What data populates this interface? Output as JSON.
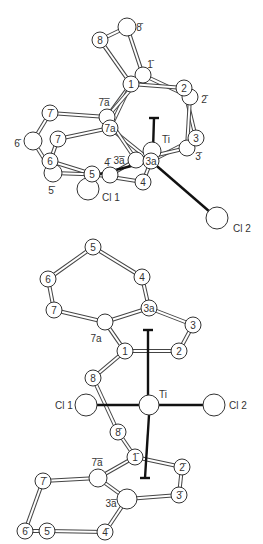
{
  "figure": {
    "type": "molecular structure diagram",
    "views": [
      {
        "name": "top-view",
        "atoms": [
          {
            "id": "8",
            "label": "8",
            "x": 100,
            "y": 40,
            "r": 8,
            "labeled_inside": true
          },
          {
            "id": "8b",
            "label": "8̄",
            "x": 127,
            "y": 27,
            "r": 9,
            "label_x": 139,
            "label_y": 27
          },
          {
            "id": "1b",
            "label": "1̄",
            "x": 143,
            "y": 75,
            "r": 8,
            "label_x": 150,
            "label_y": 64
          },
          {
            "id": "1",
            "label": "1",
            "x": 131,
            "y": 84,
            "r": 8,
            "labeled_inside": true
          },
          {
            "id": "2b",
            "label": "2̄",
            "x": 190,
            "y": 97,
            "r": 8,
            "label_x": 204,
            "label_y": 99
          },
          {
            "id": "2",
            "label": "2",
            "x": 184,
            "y": 88,
            "r": 8,
            "labeled_inside": true
          },
          {
            "id": "7ab",
            "label": "7a̅",
            "x": 107,
            "y": 117,
            "r": 8,
            "label_x": 104,
            "label_y": 102
          },
          {
            "id": "7b",
            "label": "7̄",
            "x": 50,
            "y": 113,
            "r": 8,
            "labeled_inside": true
          },
          {
            "id": "6b",
            "label": "6̄",
            "x": 33,
            "y": 141,
            "r": 9,
            "label_x": 17,
            "label_y": 143
          },
          {
            "id": "7",
            "label": "7",
            "x": 58,
            "y": 139,
            "r": 8,
            "labeled_inside": true
          },
          {
            "id": "7a",
            "label": "7a",
            "x": 110,
            "y": 128,
            "r": 8,
            "labeled_inside": true
          },
          {
            "id": "3ab",
            "label": "3a̅",
            "x": 136,
            "y": 160,
            "r": 8,
            "label_x": 119,
            "label_y": 160
          },
          {
            "id": "3b",
            "label": "3̄",
            "x": 187,
            "y": 148,
            "r": 8,
            "label_x": 198,
            "label_y": 156
          },
          {
            "id": "3",
            "label": "3",
            "x": 196,
            "y": 138,
            "r": 8,
            "labeled_inside": true
          },
          {
            "id": "Ti",
            "label": "Ti",
            "x": 152,
            "y": 151,
            "r": 9,
            "label_x": 166,
            "label_y": 139
          },
          {
            "id": "3a",
            "label": "3a",
            "x": 151,
            "y": 161,
            "r": 8,
            "labeled_inside": true
          },
          {
            "id": "5b",
            "label": "5̄",
            "x": 53,
            "y": 173,
            "r": 9,
            "label_x": 51,
            "label_y": 190
          },
          {
            "id": "6",
            "label": "6",
            "x": 50,
            "y": 161,
            "r": 8,
            "labeled_inside": true
          },
          {
            "id": "4b",
            "label": "4̄",
            "x": 110,
            "y": 175,
            "r": 8,
            "label_x": 107,
            "label_y": 162
          },
          {
            "id": "Cl1",
            "label": "Cl 1",
            "x": 88,
            "y": 189,
            "r": 11,
            "label_x": 111,
            "label_y": 197
          },
          {
            "id": "5",
            "label": "5",
            "x": 92,
            "y": 174,
            "r": 8,
            "labeled_inside": true
          },
          {
            "id": "4",
            "label": "4",
            "x": 143,
            "y": 182,
            "r": 8,
            "labeled_inside": true
          },
          {
            "id": "Cl2",
            "label": "Cl 2",
            "x": 217,
            "y": 218,
            "r": 11,
            "label_x": 242,
            "label_y": 228
          }
        ]
      },
      {
        "name": "bottom-view",
        "atoms": [
          {
            "id": "5",
            "label": "5",
            "x": 93,
            "y": 247,
            "r": 8,
            "labeled_inside": true
          },
          {
            "id": "4",
            "label": "4",
            "x": 142,
            "y": 277,
            "r": 8,
            "labeled_inside": true
          },
          {
            "id": "6",
            "label": "6",
            "x": 48,
            "y": 279,
            "r": 8,
            "labeled_inside": true
          },
          {
            "id": "7",
            "label": "7",
            "x": 54,
            "y": 310,
            "r": 8,
            "labeled_inside": true
          },
          {
            "id": "3a",
            "label": "3a",
            "x": 149,
            "y": 308,
            "r": 8,
            "labeled_inside": true
          },
          {
            "id": "3",
            "label": "3",
            "x": 193,
            "y": 325,
            "r": 8,
            "labeled_inside": true
          },
          {
            "id": "7a",
            "label": "7a",
            "x": 105,
            "y": 322,
            "r": 8,
            "label_x": 96,
            "label_y": 338
          },
          {
            "id": "1",
            "label": "1",
            "x": 125,
            "y": 351,
            "r": 8,
            "labeled_inside": true
          },
          {
            "id": "2",
            "label": "2",
            "x": 179,
            "y": 351,
            "r": 8,
            "labeled_inside": true
          },
          {
            "id": "8",
            "label": "8",
            "x": 93,
            "y": 378,
            "r": 8,
            "labeled_inside": true
          },
          {
            "id": "Ti",
            "label": "Ti",
            "x": 149,
            "y": 405,
            "r": 10,
            "label_x": 163,
            "label_y": 394
          },
          {
            "id": "Cl1",
            "label": "Cl 1",
            "x": 86,
            "y": 405,
            "r": 11,
            "label_x": 64,
            "label_y": 405
          },
          {
            "id": "Cl2",
            "label": "Cl 2",
            "x": 214,
            "y": 405,
            "r": 11,
            "label_x": 238,
            "label_y": 405
          },
          {
            "id": "8b",
            "label": "8̄",
            "x": 118,
            "y": 432,
            "r": 8,
            "labeled_inside": true
          },
          {
            "id": "1b",
            "label": "1̄",
            "x": 135,
            "y": 457,
            "r": 8,
            "labeled_inside": true
          },
          {
            "id": "2b",
            "label": "2̄",
            "x": 182,
            "y": 467,
            "r": 8,
            "labeled_inside": true
          },
          {
            "id": "7ab",
            "label": "7a̅",
            "x": 98,
            "y": 478,
            "r": 9,
            "label_x": 97,
            "label_y": 462
          },
          {
            "id": "7b",
            "label": "7̄",
            "x": 43,
            "y": 481,
            "r": 8,
            "labeled_inside": true
          },
          {
            "id": "3ab",
            "label": "3a̅",
            "x": 127,
            "y": 499,
            "r": 10,
            "label_x": 111,
            "label_y": 503
          },
          {
            "id": "3b",
            "label": "3̄",
            "x": 179,
            "y": 495,
            "r": 8,
            "labeled_inside": true
          },
          {
            "id": "6b",
            "label": "6̄",
            "x": 25,
            "y": 531,
            "r": 8,
            "labeled_inside": true
          },
          {
            "id": "5b",
            "label": "5̄",
            "x": 47,
            "y": 531,
            "r": 8,
            "labeled_inside": true
          },
          {
            "id": "4b",
            "label": "4̄",
            "x": 105,
            "y": 532,
            "r": 8,
            "labeled_inside": true
          }
        ]
      }
    ]
  },
  "labels": {
    "ti": "Ti",
    "cl1": "Cl 1",
    "cl2": "Cl 2"
  }
}
